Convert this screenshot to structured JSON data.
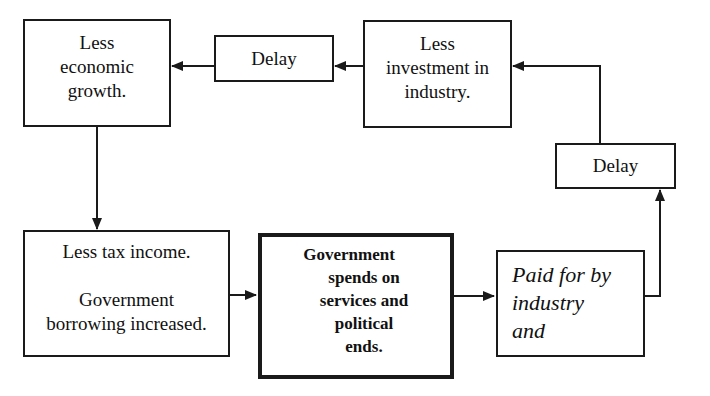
{
  "diagram": {
    "nodes": {
      "less_growth": {
        "lines": [
          "Less",
          "economic",
          "growth."
        ]
      },
      "delay_top": {
        "label": "Delay"
      },
      "less_investment": {
        "lines": [
          "Less",
          "investment in",
          "industry."
        ]
      },
      "delay_right": {
        "label": "Delay"
      },
      "less_tax": {
        "line1": "Less tax income.",
        "line2": "Government",
        "line3": "borrowing increased."
      },
      "gov_spends": {
        "lines": [
          "Government",
          "spends on",
          "services and",
          "political",
          "ends."
        ]
      },
      "paid_for": {
        "lines": [
          "Paid for by",
          "industry",
          "and"
        ]
      }
    },
    "edges": [
      {
        "from": "paid_for",
        "to": "delay_right"
      },
      {
        "from": "delay_right",
        "to": "less_investment"
      },
      {
        "from": "less_investment",
        "to": "delay_top"
      },
      {
        "from": "delay_top",
        "to": "less_growth"
      },
      {
        "from": "less_growth",
        "to": "less_tax"
      },
      {
        "from": "less_tax",
        "to": "gov_spends"
      },
      {
        "from": "gov_spends",
        "to": "paid_for"
      }
    ],
    "colors": {
      "line": "#1a1a1a",
      "background": "#ffffff"
    }
  }
}
